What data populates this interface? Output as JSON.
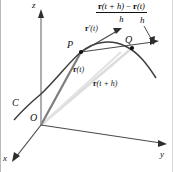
{
  "figure": {
    "background_color": "#ffffff",
    "line_color": "#333333",
    "curve_color": "#3a3a3a",
    "light_vector_color": "#d9d9d9",
    "dark_vector_color": "#6f6f6f",
    "axes": {
      "z_label": "z",
      "x_label": "x",
      "y_label": "y"
    },
    "points": {
      "origin_label": "O",
      "p_label": "P",
      "q_label": "Q"
    },
    "curve": {
      "label": "C"
    },
    "vectors": {
      "position_t_bold": "r",
      "position_t_arg": "(t)",
      "position_th_bold": "r",
      "position_th_arg": "(t + h)",
      "tangent_bold": "r",
      "tangent_prime": "′",
      "tangent_arg": "(t)"
    },
    "formula": {
      "numerator_r1": "r",
      "numerator_arg1": "(t + h)",
      "numerator_minus": " − ",
      "numerator_r2": "r",
      "numerator_arg2": "(t)",
      "denominator": "h",
      "leader_label": "h"
    }
  }
}
